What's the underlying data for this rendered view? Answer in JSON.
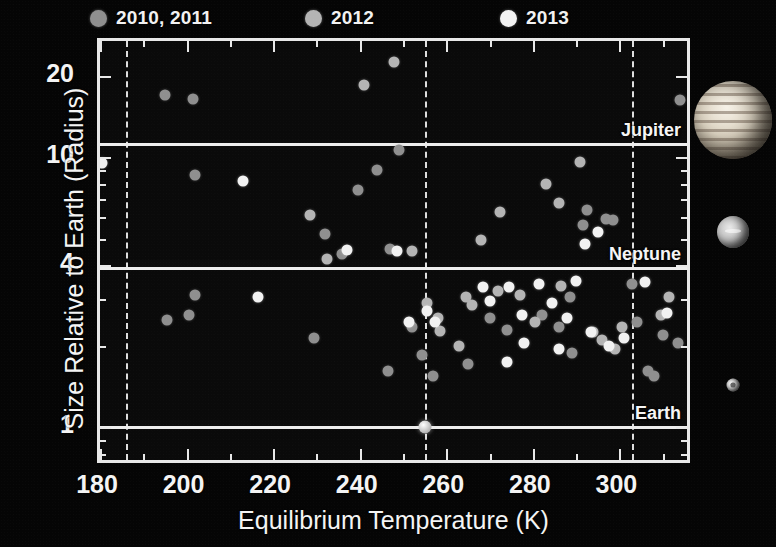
{
  "legend": {
    "items": [
      {
        "label": "2010, 2011",
        "color": "#8f8f8f",
        "x": 90
      },
      {
        "label": "2012",
        "color": "#b4b4b4",
        "x": 305
      },
      {
        "label": "2013",
        "color": "#f2f2f2",
        "x": 500
      }
    ]
  },
  "axes": {
    "x_title": "Equilibrium Temperature (K)",
    "y_title": "Size Relative to Earth (Radius)",
    "x_ticks": [
      180,
      200,
      220,
      240,
      260,
      280,
      300
    ],
    "y_ticks": [
      20,
      10,
      4,
      1
    ]
  },
  "reference_lines": [
    {
      "label": "Jupiter",
      "radius": 11.2
    },
    {
      "label": "Neptune",
      "radius": 3.88
    },
    {
      "label": "Earth",
      "radius": 1.0
    }
  ],
  "habitable_zone": {
    "inner_temp": 303,
    "outer_temp": 186,
    "center_temp": 255
  },
  "planet_thumbnails": [
    {
      "name": "jupiter",
      "size": 78,
      "cx": 43,
      "cy": 120
    },
    {
      "name": "neptune",
      "size": 32,
      "cx": 43,
      "cy": 232
    },
    {
      "name": "earth",
      "size": 13,
      "cx": 43,
      "cy": 385
    }
  ],
  "chart_data": {
    "type": "scatter",
    "title": "",
    "xlabel": "Equilibrium Temperature (K)",
    "ylabel": "Size Relative to Earth (Radius)",
    "xlim": [
      180,
      317
    ],
    "ylim": [
      0.72,
      27
    ],
    "yscale": "log",
    "xscale": "linear",
    "grid": false,
    "legend_position": "top",
    "series": [
      {
        "name": "2010, 2011",
        "color": "#8f8f8f",
        "points": [
          [
            195.0,
            17.0
          ],
          [
            201.5,
            16.5
          ],
          [
            202.0,
            8.6
          ],
          [
            232.0,
            5.2
          ],
          [
            236.0,
            4.4
          ],
          [
            247.0,
            4.6
          ],
          [
            249.0,
            10.7
          ],
          [
            244.0,
            9.0
          ],
          [
            239.5,
            7.6
          ],
          [
            195.5,
            2.5
          ],
          [
            200.5,
            2.6
          ],
          [
            202.0,
            3.1
          ],
          [
            229.5,
            2.15
          ],
          [
            246.5,
            1.62
          ],
          [
            252.0,
            2.35
          ],
          [
            254.5,
            1.85
          ],
          [
            257.0,
            1.55
          ],
          [
            265.0,
            1.72
          ],
          [
            270.0,
            2.55
          ],
          [
            274.0,
            2.3
          ],
          [
            282.0,
            2.6
          ],
          [
            286.0,
            2.35
          ],
          [
            289.0,
            1.88
          ],
          [
            288.5,
            3.05
          ],
          [
            291.5,
            5.6
          ],
          [
            292.5,
            6.4
          ],
          [
            297.0,
            5.9
          ],
          [
            298.5,
            5.85
          ],
          [
            304.0,
            2.45
          ],
          [
            306.5,
            1.62
          ],
          [
            308.0,
            1.55
          ],
          [
            310.0,
            2.2
          ],
          [
            313.5,
            2.05
          ],
          [
            303.0,
            3.4
          ],
          [
            314.0,
            16.3
          ]
        ]
      },
      {
        "name": "2012",
        "color": "#b4b4b4",
        "points": [
          [
            241.0,
            18.5
          ],
          [
            248.0,
            22.6
          ],
          [
            228.5,
            6.1
          ],
          [
            252.0,
            4.5
          ],
          [
            268.0,
            4.95
          ],
          [
            272.5,
            6.3
          ],
          [
            283.0,
            8.0
          ],
          [
            286.0,
            6.8
          ],
          [
            291.0,
            9.6
          ],
          [
            232.5,
            4.2
          ],
          [
            264.5,
            3.05
          ],
          [
            266.0,
            2.85
          ],
          [
            272.0,
            3.2
          ],
          [
            277.0,
            3.1
          ],
          [
            280.5,
            2.45
          ],
          [
            286.5,
            3.35
          ],
          [
            294.0,
            2.25
          ],
          [
            296.0,
            2.1
          ],
          [
            299.0,
            1.95
          ],
          [
            300.5,
            2.35
          ],
          [
            309.5,
            2.6
          ],
          [
            311.5,
            3.05
          ],
          [
            263.0,
            2.0
          ],
          [
            258.0,
            2.55
          ],
          [
            255.5,
            2.9
          ],
          [
            258.5,
            2.28
          ]
        ]
      },
      {
        "name": "2013",
        "color": "#f2f2f2",
        "points": [
          [
            180.5,
            9.5
          ],
          [
            213.0,
            8.2
          ],
          [
            216.5,
            3.05
          ],
          [
            237.0,
            4.55
          ],
          [
            248.5,
            4.5
          ],
          [
            251.5,
            2.45
          ],
          [
            255.5,
            2.7
          ],
          [
            257.5,
            2.45
          ],
          [
            268.5,
            3.3
          ],
          [
            270.0,
            2.95
          ],
          [
            274.5,
            3.3
          ],
          [
            277.5,
            2.6
          ],
          [
            281.5,
            3.4
          ],
          [
            284.5,
            2.9
          ],
          [
            288.0,
            2.55
          ],
          [
            290.0,
            3.5
          ],
          [
            292.0,
            4.8
          ],
          [
            295.0,
            5.3
          ],
          [
            293.5,
            2.25
          ],
          [
            297.5,
            2.0
          ],
          [
            301.0,
            2.15
          ],
          [
            306.0,
            3.45
          ],
          [
            311.0,
            2.65
          ],
          [
            278.0,
            2.05
          ],
          [
            286.0,
            1.95
          ],
          [
            274.0,
            1.75
          ],
          [
            255.0,
            1.0
          ]
        ]
      }
    ],
    "reference_lines": [
      {
        "label": "Jupiter",
        "y": 11.2
      },
      {
        "label": "Neptune",
        "y": 3.88
      },
      {
        "label": "Earth",
        "y": 1.0
      }
    ],
    "vertical_lines": [
      186,
      255,
      303
    ],
    "annotations": [
      "Jupiter",
      "Neptune",
      "Earth"
    ]
  }
}
